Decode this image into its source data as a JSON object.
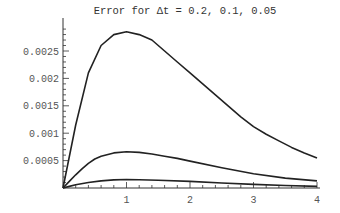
{
  "chart_data": {
    "type": "line",
    "title": "Error for Δt = 0.2, 0.1, 0.05",
    "xlabel": "",
    "ylabel": "",
    "xlim": [
      0,
      4
    ],
    "ylim": [
      0,
      0.0029
    ],
    "grid": false,
    "legend": "none",
    "x_ticks": [
      1,
      2,
      3,
      4
    ],
    "x_tick_labels": [
      "1",
      "2",
      "3",
      "4"
    ],
    "y_ticks": [
      0.0005,
      0.001,
      0.0015,
      0.002,
      0.0025
    ],
    "y_tick_labels": [
      "0.0005",
      "0.001",
      "0.0015",
      "0.002",
      "0.0025"
    ],
    "series": [
      {
        "name": "Δt = 0.2",
        "x": [
          0,
          0.2,
          0.4,
          0.6,
          0.8,
          1.0,
          1.2,
          1.4,
          1.6,
          1.8,
          2.0,
          2.2,
          2.4,
          2.6,
          2.8,
          3.0,
          3.2,
          3.4,
          3.6,
          3.8,
          4.0
        ],
        "values": [
          0,
          0.00115,
          0.0021,
          0.0026,
          0.0028,
          0.00285,
          0.0028,
          0.0027,
          0.0025,
          0.0023,
          0.0021,
          0.0019,
          0.0017,
          0.0015,
          0.0013,
          0.00112,
          0.00098,
          0.00086,
          0.00074,
          0.00064,
          0.00055
        ]
      },
      {
        "name": "Δt = 0.1",
        "x": [
          0,
          0.1,
          0.2,
          0.3,
          0.4,
          0.5,
          0.6,
          0.8,
          1.0,
          1.2,
          1.4,
          1.6,
          1.8,
          2.0,
          2.5,
          3.0,
          3.5,
          4.0
        ],
        "values": [
          0,
          0.00012,
          0.00024,
          0.00035,
          0.00045,
          0.00053,
          0.00058,
          0.00064,
          0.00066,
          0.00065,
          0.00062,
          0.00058,
          0.00054,
          0.00049,
          0.00037,
          0.00026,
          0.00018,
          0.00013
        ]
      },
      {
        "name": "Δt = 0.05",
        "x": [
          0,
          0.1,
          0.2,
          0.4,
          0.6,
          0.8,
          1.0,
          1.2,
          1.5,
          2.0,
          2.5,
          3.0,
          3.5,
          4.0
        ],
        "values": [
          0,
          3e-05,
          6e-05,
          0.0001,
          0.00013,
          0.000148,
          0.000155,
          0.000152,
          0.000142,
          0.00012,
          9.2e-05,
          6.6e-05,
          4.6e-05,
          3e-05
        ]
      }
    ]
  },
  "colors": {
    "line": "#222222",
    "axis": "#333333",
    "text": "#555555",
    "background": "#ffffff"
  }
}
